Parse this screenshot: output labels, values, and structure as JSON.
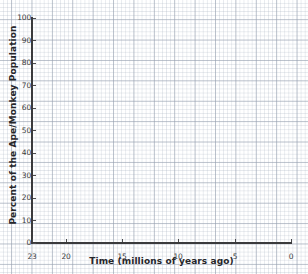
{
  "chart_data": {
    "type": "line",
    "title": "",
    "subtitle": "",
    "xlabel": "Time (millions of years ago)",
    "ylabel": "Percent of the Ape/Monkey Population",
    "xlim": [
      23,
      0
    ],
    "ylim": [
      0,
      100
    ],
    "x_axis_reversed": true,
    "grid": true,
    "grid_style": "graph-paper",
    "legend": "none",
    "x_ticks": [
      23,
      20,
      15,
      10,
      5,
      0
    ],
    "x_tick_labels": [
      "23",
      "20",
      "15",
      "10",
      "5",
      "0"
    ],
    "y_ticks": [
      0,
      10,
      20,
      30,
      40,
      50,
      60,
      70,
      80,
      90,
      100
    ],
    "y_tick_labels": [
      "0",
      "10",
      "20",
      "30",
      "40",
      "50",
      "60",
      "70",
      "80",
      "90",
      "100"
    ],
    "series": [],
    "annotations": [],
    "note": "Blank plotting grid — no data series are drawn on the axes."
  },
  "colors": {
    "axis": "#3a3a3c",
    "text": "#26262a",
    "tick_text": "#3b3b3d",
    "grid_minor": "#aab4c3",
    "grid_major": "#96a0af",
    "background": "#ffffff"
  }
}
